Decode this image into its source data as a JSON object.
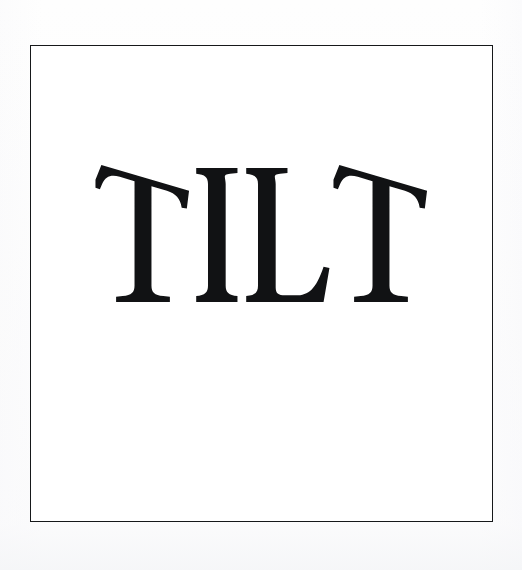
{
  "artwork": {
    "kind": "album-cover-scan",
    "word": "TILT",
    "letters": [
      {
        "char": "T",
        "style": "tilted-crossbar",
        "tilt_degrees": -14
      },
      {
        "char": "I",
        "style": "upright",
        "tilt_degrees": 0
      },
      {
        "char": "L",
        "style": "upright",
        "tilt_degrees": 0
      },
      {
        "char": "T",
        "style": "tilted-crossbar",
        "tilt_degrees": -14
      }
    ],
    "typeface_style": "didone-serif-high-contrast",
    "alt_text": "The word TILT set in a high-contrast serif typeface, with both T crossbars rotated so they slope downward to the right."
  },
  "frame": {
    "label": "cover-border",
    "stroke_color": "#16181a",
    "stroke_width_px": 1.4,
    "x": 30,
    "y": 45,
    "width": 463,
    "height": 477
  },
  "colors": {
    "ink": "#111214",
    "rule": "#16181a",
    "cover_background": "#ffffff",
    "page_background": "#fefefe"
  },
  "canvas": {
    "width": 522,
    "height": 570
  }
}
